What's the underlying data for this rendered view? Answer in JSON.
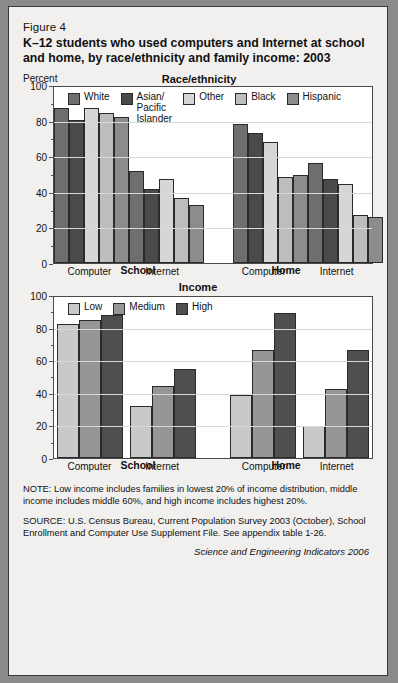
{
  "figure": {
    "number": "Figure 4",
    "title": "K–12 students who used computers and Internet at school and home, by race/ethnicity and family income: 2003",
    "percent_label": "Percent",
    "credit": "Science and Engineering Indicators 2006"
  },
  "notes": {
    "note": "NOTE: Low income includes families in lowest 20% of income distribution, middle income includes middle 60%, and high income includes highest 20%.",
    "source": "SOURCE: U.S. Census Bureau, Current Population Survey 2003 (October), School Enrollment and Computer Use Supplement File. See appendix table 1-26."
  },
  "colors": {
    "white": "#6e6e6e",
    "asian": "#4a4a4a",
    "other": "#d6d6d6",
    "black": "#bdbdbd",
    "hispanic": "#8c8c8c",
    "low": "#c9c9c9",
    "medium": "#969696",
    "high": "#4f4f4f"
  },
  "chart_data": [
    {
      "type": "bar",
      "title": "Race/ethnicity",
      "ylabel": "Percent",
      "xlabel": "",
      "ylim": [
        0,
        100
      ],
      "yticks": [
        0,
        20,
        40,
        60,
        80,
        100
      ],
      "grid": true,
      "legend_position": "top",
      "categories": [
        "Computer",
        "Internet",
        "Computer",
        "Internet"
      ],
      "group_labels": [
        "School",
        "Home"
      ],
      "series": [
        {
          "name": "White",
          "values": [
            88,
            52,
            79,
            57
          ]
        },
        {
          "name": "Asian/\nPacific\nIslander",
          "values": [
            81,
            42,
            74,
            48
          ]
        },
        {
          "name": "Other",
          "values": [
            88,
            48,
            69,
            45
          ]
        },
        {
          "name": "Black",
          "values": [
            85,
            37,
            49,
            27
          ]
        },
        {
          "name": "Hispanic",
          "values": [
            83,
            33,
            50,
            26
          ]
        }
      ]
    },
    {
      "type": "bar",
      "title": "Income",
      "ylabel": "Percent",
      "xlabel": "",
      "ylim": [
        0,
        100
      ],
      "yticks": [
        0,
        20,
        40,
        60,
        80,
        100
      ],
      "grid": true,
      "legend_position": "top",
      "categories": [
        "Computer",
        "Internet",
        "Computer",
        "Internet"
      ],
      "group_labels": [
        "School",
        "Home"
      ],
      "series": [
        {
          "name": "Low",
          "values": [
            83,
            32,
            39,
            20
          ]
        },
        {
          "name": "Medium",
          "values": [
            86,
            45,
            67,
            43
          ]
        },
        {
          "name": "High",
          "values": [
            89,
            55,
            90,
            67
          ]
        }
      ]
    }
  ]
}
